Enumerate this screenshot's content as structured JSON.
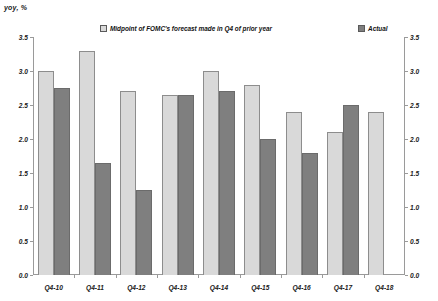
{
  "chart_data": {
    "type": "bar",
    "title": "",
    "axis_unit_label": "yoy, %",
    "xlabel": "",
    "ylabel": "",
    "ylim": [
      0,
      3.5
    ],
    "ytick_step": 0.5,
    "grid": false,
    "legend_position": "top",
    "dual_y_axis": true,
    "categories": [
      "Q4-10",
      "Q4-11",
      "Q4-12",
      "Q4-13",
      "Q4-14",
      "Q4-15",
      "Q4-16",
      "Q4-17",
      "Q4-18"
    ],
    "ticks": [
      "0.0",
      "0.5",
      "1.0",
      "1.5",
      "2.0",
      "2.5",
      "3.0",
      "3.5"
    ],
    "series": [
      {
        "name": "Midpoint of FOMC's forecast made in Q4 of prior year",
        "color": "#d9d9d9",
        "values": [
          3.0,
          3.3,
          2.7,
          2.65,
          3.0,
          2.8,
          2.4,
          2.1,
          2.4
        ]
      },
      {
        "name": "Actual",
        "color": "#7f7f7f",
        "values": [
          2.75,
          1.65,
          1.25,
          2.65,
          2.7,
          2.0,
          1.8,
          2.5,
          null
        ]
      }
    ]
  }
}
